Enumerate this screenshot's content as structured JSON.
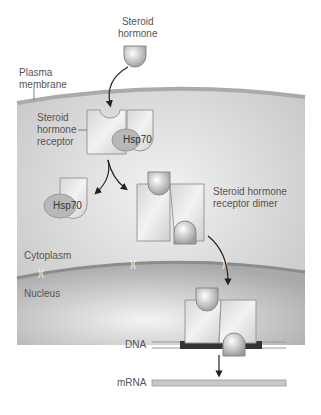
{
  "labels": {
    "steroid_hormone": [
      "Steroid",
      "hormone"
    ],
    "plasma_membrane": [
      "Plasma",
      "membrane"
    ],
    "receptor": [
      "Steroid",
      "hormone",
      "receptor"
    ],
    "hsp70_bound": "Hsp70",
    "hsp70_free": "Hsp70",
    "dimer": [
      "Steroid hormone",
      "receptor dimer"
    ],
    "cytoplasm": "Cytoplasm",
    "nucleus": "Nucleus",
    "dna": "DNA",
    "mrna": "mRNA"
  },
  "colors": {
    "cytoplasm": "#cfcfcf",
    "membrane": "#b0b0b0",
    "nucleus": "#bdbdbd",
    "protein": "#e6e6e6",
    "hsp70": "#b8b8b8",
    "dna_bound": "#333333",
    "text": "#555555"
  }
}
